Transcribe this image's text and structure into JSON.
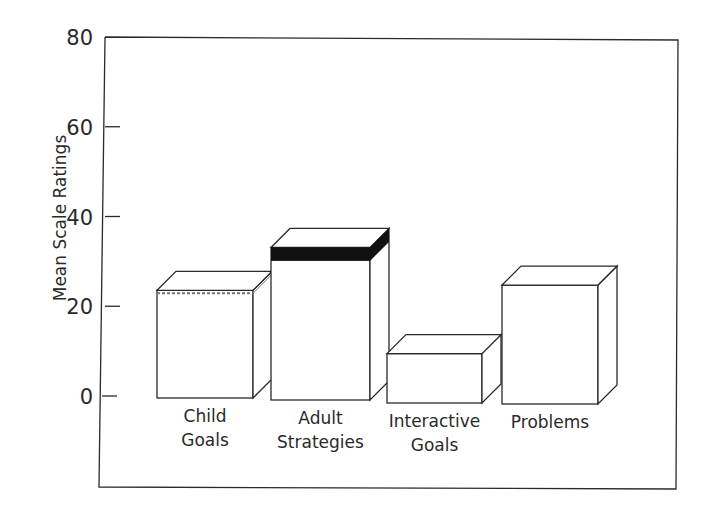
{
  "chart_data": {
    "type": "bar",
    "style": "3d-box",
    "title": "",
    "xlabel": "",
    "ylabel": "Mean Scale Ratings",
    "ylim": [
      0,
      80
    ],
    "yticks": [
      0,
      20,
      40,
      60,
      80
    ],
    "grid": false,
    "legend": null,
    "categories": [
      "Child Goals",
      "Adult Strategies",
      "Interactive Goals",
      "Problems"
    ],
    "category_label_lines": [
      [
        "Child",
        "Goals"
      ],
      [
        "Adult",
        "Strategies"
      ],
      [
        "Interactive",
        "Goals"
      ],
      [
        "Problems"
      ]
    ],
    "values": [
      24,
      34,
      11,
      26.5
    ],
    "top_bands": [
      {
        "category": "Child Goals",
        "from": 23.5,
        "to": 24,
        "style": "dashed"
      },
      {
        "category": "Adult Strategies",
        "from": 31,
        "to": 34,
        "style": "solid-black"
      }
    ]
  },
  "colors": {
    "bar_fill": "#ffffff",
    "outline": "#2a2a2a",
    "band_dark": "#111111"
  }
}
